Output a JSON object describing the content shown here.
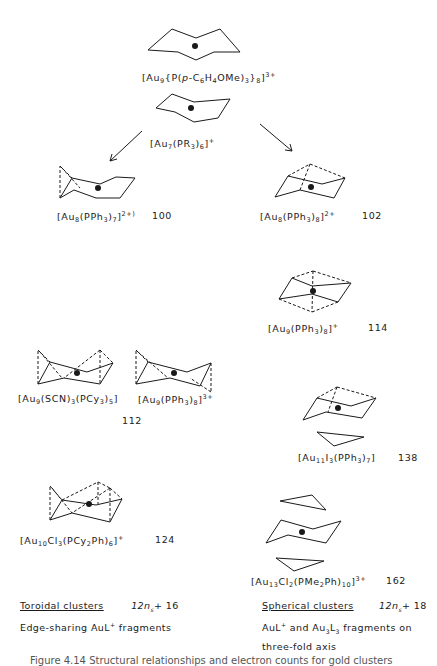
{
  "figure": {
    "stroke_color": "#1a1a1a",
    "background": "#ffffff"
  },
  "clusters": [
    {
      "id": "au9-pome",
      "formula": "[Au9{P(p-C6H4OMe)3}8]3+",
      "parts": [
        "[Au",
        "9",
        "{P(",
        "p",
        "-C",
        "6",
        "H",
        "4",
        "OMe)",
        "3",
        "}",
        "8",
        "]",
        "3+"
      ],
      "page": ""
    },
    {
      "id": "au7",
      "formula": "[Au7(PR3)6]+",
      "parts": [
        "[Au",
        "7",
        "(PR",
        "3",
        ")",
        "6",
        "]",
        "+"
      ],
      "page": ""
    },
    {
      "id": "au8-7",
      "formula": "[Au8(PPh3)7]2+",
      "parts": [
        "[Au",
        "8",
        "(PPh",
        "3",
        ")",
        "7",
        "]",
        "2+)"
      ],
      "page": "100"
    },
    {
      "id": "au8-8",
      "formula": "[Au8(PPh3)8]2+",
      "parts": [
        "[Au",
        "8",
        "(PPh",
        "3",
        ")",
        "8",
        "]",
        "2+"
      ],
      "page": "102"
    },
    {
      "id": "au9-8-plus",
      "formula": "[Au9(PPh3)8]+",
      "parts": [
        "[Au",
        "9",
        "(PPh",
        "3",
        ")",
        "8",
        "]",
        "+"
      ],
      "page": "114"
    },
    {
      "id": "au9-scn",
      "formula": "[Au9(SCN)3(PCy3)5]",
      "parts": [
        "[Au",
        "9",
        "(SCN)",
        "3",
        "(PCy",
        "3",
        ")",
        "5",
        "]"
      ],
      "page": ""
    },
    {
      "id": "au9-8-3plus",
      "formula": "[Au9(PPh3)8]3+",
      "parts": [
        "[Au",
        "9",
        "(PPh",
        "3",
        ")",
        "8",
        "]",
        "3+"
      ],
      "page": "112"
    },
    {
      "id": "au11",
      "formula": "[Au11I3(PPh3)7]",
      "parts": [
        "[Au",
        "11",
        "I",
        "3",
        "(PPh",
        "3",
        ")",
        "7",
        "]"
      ],
      "page": "138"
    },
    {
      "id": "au10",
      "formula": "[Au10Cl3(PCy2Ph)6]+",
      "parts": [
        "[Au",
        "10",
        "Cl",
        "3",
        "(PCy",
        "2",
        "Ph)",
        "6",
        "]",
        "+"
      ],
      "page": "124"
    },
    {
      "id": "au13",
      "formula": "[Au13Cl2(PMe2Ph)10]3+",
      "parts": [
        "[Au",
        "13",
        "Cl",
        "2",
        "(PMe",
        "2",
        "Ph)",
        "10",
        "]",
        "3+"
      ],
      "page": "162"
    }
  ],
  "legend": {
    "toroidal": {
      "title": "Toroidal clusters",
      "rule": "12n",
      "rule_sub": "s",
      "rule_tail": "+ 16",
      "description": "Edge-sharing AuL",
      "description_sup": "+",
      "description_tail": " fragments"
    },
    "spherical": {
      "title": "Spherical clusters",
      "rule": "12n",
      "rule_sub": "s",
      "rule_tail": "+ 18",
      "line1_a": "AuL",
      "line1_sup": "+",
      "line1_b": " and Au",
      "line1_sub1": "3",
      "line1_c": "L",
      "line1_sub2": "3",
      "line1_d": " fragments on",
      "line2": "three-fold axis"
    }
  },
  "caption": "Figure 4.14  Structural relationships and electron counts for gold clusters"
}
